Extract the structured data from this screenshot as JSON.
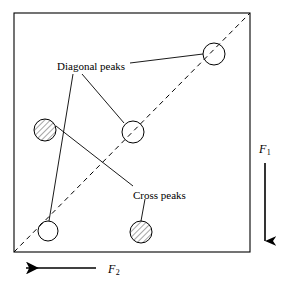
{
  "figure": {
    "kind": "2d-nmr-spectrum-schematic",
    "frame": {
      "x": 14,
      "y": 13,
      "width": 236,
      "height": 239,
      "stroke": "#000000"
    },
    "diagonal": {
      "name": "spectrum-diagonal",
      "style": "dashed",
      "from": {
        "x": 14,
        "y": 252
      },
      "to": {
        "x": 250,
        "y": 13
      }
    },
    "annotations": [
      {
        "id": "diagonal-peaks",
        "label": "Diagonal peaks",
        "x": 57,
        "y": 61
      },
      {
        "id": "cross-peaks",
        "label": "Cross peaks",
        "x": 133,
        "y": 190
      }
    ],
    "peaks": [
      {
        "id": "diagonal-peak-bottom-left",
        "type": "diagonal",
        "fill": "none",
        "cx": 48,
        "cy": 231,
        "r": 10
      },
      {
        "id": "diagonal-peak-center",
        "type": "diagonal",
        "fill": "none",
        "cx": 133,
        "cy": 132,
        "r": 11
      },
      {
        "id": "diagonal-peak-top-right",
        "type": "diagonal",
        "fill": "none",
        "cx": 214,
        "cy": 54,
        "r": 11
      },
      {
        "id": "cross-peak-left",
        "type": "cross",
        "fill": "hatched",
        "cx": 45,
        "cy": 130,
        "r": 11
      },
      {
        "id": "cross-peak-bottom",
        "type": "cross",
        "fill": "hatched",
        "cx": 141,
        "cy": 232,
        "r": 11
      }
    ],
    "leaders": [
      {
        "id": "leader-diagonal-to-top-right",
        "from": {
          "x": 130,
          "y": 63
        },
        "to": {
          "x": 203,
          "y": 54
        }
      },
      {
        "id": "leader-diagonal-to-center",
        "from": {
          "x": 82,
          "y": 74
        },
        "to": {
          "x": 124,
          "y": 123
        }
      },
      {
        "id": "leader-diagonal-to-bottom-left",
        "from": {
          "x": 73,
          "y": 74
        },
        "to": {
          "x": 49,
          "y": 221
        }
      },
      {
        "id": "leader-cross-to-left",
        "from": {
          "x": 133,
          "y": 186
        },
        "to": {
          "x": 56,
          "y": 126
        }
      },
      {
        "id": "leader-cross-to-bottom",
        "from": {
          "x": 145,
          "y": 199
        },
        "to": {
          "x": 141,
          "y": 221
        }
      }
    ],
    "axes": {
      "f1": {
        "name": "f1-axis",
        "label": "F",
        "subscript": "1",
        "direction": "down",
        "label_x": 259,
        "label_y": 143,
        "line": {
          "x": 265,
          "y1": 163,
          "y2": 245
        }
      },
      "f2": {
        "name": "f2-axis",
        "label": "F",
        "subscript": "2",
        "direction": "left",
        "label_x": 108,
        "label_y": 263,
        "line": {
          "y": 268,
          "x1": 96,
          "x2": 22
        }
      }
    },
    "colors": {
      "ink": "#000000",
      "background": "#ffffff"
    }
  }
}
